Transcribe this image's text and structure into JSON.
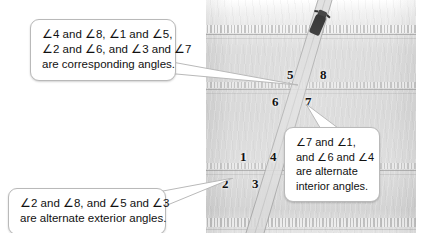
{
  "figure": {
    "scene": "aerial-photo-of-two-parallel-roads-crossed-by-a-diagonal-road",
    "vehicle": "dark-car-on-diagonal-road"
  },
  "angle_labels": [
    {
      "id": "angle-5",
      "text": "5",
      "x": 287,
      "y": 68,
      "position": "upper-intersection-upper-left"
    },
    {
      "id": "angle-8",
      "text": "8",
      "x": 320,
      "y": 68,
      "position": "upper-intersection-upper-right"
    },
    {
      "id": "angle-6",
      "text": "6",
      "x": 272,
      "y": 95,
      "position": "upper-intersection-lower-left"
    },
    {
      "id": "angle-7",
      "text": "7",
      "x": 305,
      "y": 95,
      "position": "upper-intersection-lower-right"
    },
    {
      "id": "angle-1",
      "text": "1",
      "x": 240,
      "y": 150,
      "position": "lower-intersection-upper-left"
    },
    {
      "id": "angle-4",
      "text": "4",
      "x": 270,
      "y": 150,
      "position": "lower-intersection-upper-right"
    },
    {
      "id": "angle-2",
      "text": "2",
      "x": 222,
      "y": 177,
      "position": "lower-intersection-lower-left"
    },
    {
      "id": "angle-3",
      "text": "3",
      "x": 252,
      "y": 177,
      "position": "lower-intersection-lower-right"
    }
  ],
  "callouts": {
    "corresponding": {
      "id": "callout-corresponding-angles",
      "lines": [
        "∠4 and ∠8, ∠1 and ∠5,",
        "∠2 and ∠6, and ∠3 and ∠7",
        "are corresponding angles."
      ],
      "points_to": "upper-intersection"
    },
    "alternate_exterior": {
      "id": "callout-alternate-exterior-angles",
      "lines": [
        "∠2 and ∠8, and ∠5 and ∠3",
        "are alternate exterior angles."
      ],
      "points_to": "lower-intersection"
    },
    "alternate_interior": {
      "id": "callout-alternate-interior-angles",
      "lines": [
        "∠7 and ∠1,",
        "and ∠6 and ∠4",
        "are alternate",
        "interior angles."
      ],
      "points_to": "angle-7"
    }
  },
  "colors": {
    "page_background": "#ffffff",
    "callout_background": "#ffffff",
    "callout_border": "#b9b9b9",
    "text": "#111111",
    "road_asphalt": "#d4d4d4",
    "lane_line": "#828282",
    "vehicle": "#2b2b2b"
  }
}
